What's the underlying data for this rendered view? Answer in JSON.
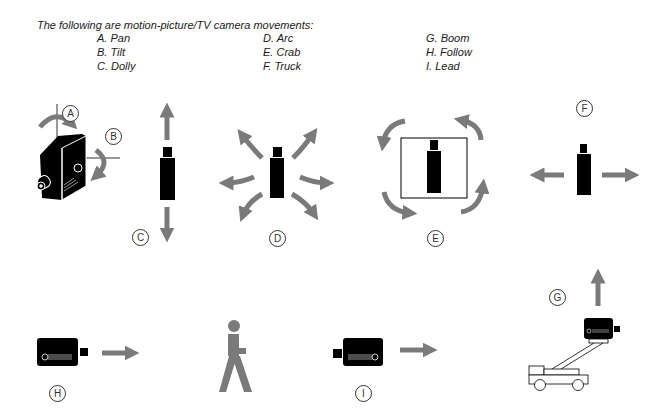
{
  "header": {
    "title": "The following are motion-picture/TV camera movements:"
  },
  "movements": [
    {
      "letter": "A",
      "label": "A. Pan"
    },
    {
      "letter": "B",
      "label": "B. Tilt"
    },
    {
      "letter": "C",
      "label": "C. Dolly"
    },
    {
      "letter": "D",
      "label": "D. Arc"
    },
    {
      "letter": "E",
      "label": "E. Crab"
    },
    {
      "letter": "F",
      "label": "F. Truck"
    },
    {
      "letter": "G",
      "label": "G. Boom"
    },
    {
      "letter": "H",
      "label": "H. Follow"
    },
    {
      "letter": "I",
      "label": "I. Lead"
    }
  ],
  "markers": {
    "A": "A",
    "B": "B",
    "C": "C",
    "D": "D",
    "E": "E",
    "F": "F",
    "G": "G",
    "H": "H",
    "I": "I"
  },
  "colors": {
    "arrow": "#7a7a7a",
    "camera": "#000000",
    "figure": "#7a7a7a"
  }
}
